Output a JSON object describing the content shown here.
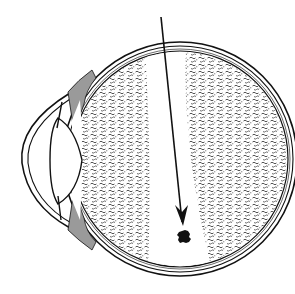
{
  "diagram": {
    "type": "anatomical-illustration",
    "parts": [
      {
        "id": "cornea",
        "label": ""
      },
      {
        "id": "lens",
        "label": ""
      },
      {
        "id": "sclera",
        "label": ""
      },
      {
        "id": "vitreous",
        "label": ""
      },
      {
        "id": "beam-channel",
        "label": ""
      },
      {
        "id": "arrow",
        "label": ""
      },
      {
        "id": "target-spot",
        "label": ""
      }
    ],
    "colors": {
      "background": "#ffffff",
      "ink": "#111111",
      "stipple": "#2a2a2a",
      "ciliary_gray": "#9a9a9a"
    }
  }
}
